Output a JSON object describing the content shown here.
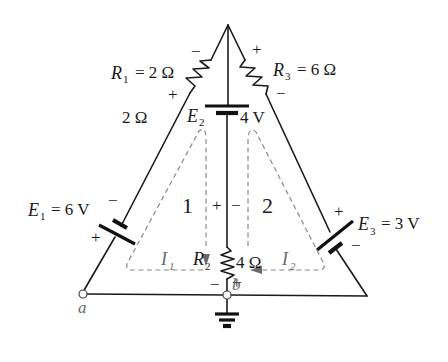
{
  "diagram": {
    "type": "circuit-schematic",
    "components": {
      "R1": {
        "symbol": "R",
        "sub": "1",
        "value": "= 2 Ω",
        "extra_label": "2 Ω",
        "polarity_top": "−",
        "polarity_bottom": "+"
      },
      "R2": {
        "symbol": "R",
        "sub": "2",
        "value": "4 Ω",
        "polarity_top_left": "+",
        "polarity_top_right": "−",
        "polarity_bottom_left": "−",
        "polarity_bottom_right": "+"
      },
      "R3": {
        "symbol": "R",
        "sub": "3",
        "value": "= 6 Ω",
        "polarity_top": "+",
        "polarity_bottom": "−"
      },
      "E1": {
        "symbol": "E",
        "sub": "1",
        "value": "= 6 V",
        "polarity_top": "−",
        "polarity_bottom": "+"
      },
      "E2": {
        "symbol": "E",
        "sub": "2",
        "value": "4 V"
      },
      "E3": {
        "symbol": "E",
        "sub": "3",
        "value": "= 3 V",
        "polarity_top": "+",
        "polarity_bottom": "−"
      }
    },
    "loops": [
      {
        "number": "1",
        "current_symbol": "I",
        "current_sub": "1"
      },
      {
        "number": "2",
        "current_symbol": "I",
        "current_sub": "2"
      }
    ],
    "nodes": {
      "a": "a",
      "b": "b"
    },
    "ground": "ground-symbol"
  }
}
